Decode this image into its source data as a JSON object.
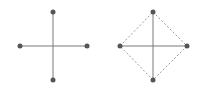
{
  "colors": {
    "background": "#ffffff",
    "solid_line": "#7a7a7a",
    "dashed_line": "#9a9a9a",
    "node": "#555555"
  },
  "figures": [
    {
      "name": "cross",
      "center": [
        53,
        46
      ],
      "nodes": [
        [
          53,
          12
        ],
        [
          20,
          46
        ],
        [
          87,
          46
        ],
        [
          53,
          80
        ]
      ],
      "solid_edges": [
        [
          [
            53,
            12
          ],
          [
            53,
            80
          ]
        ],
        [
          [
            20,
            46
          ],
          [
            87,
            46
          ]
        ]
      ],
      "dashed_edges": []
    },
    {
      "name": "diamond-cross",
      "center": [
        153,
        46
      ],
      "nodes": [
        [
          153,
          12
        ],
        [
          120,
          46
        ],
        [
          187,
          46
        ],
        [
          153,
          80
        ]
      ],
      "solid_edges": [
        [
          [
            153,
            12
          ],
          [
            153,
            80
          ]
        ],
        [
          [
            120,
            46
          ],
          [
            187,
            46
          ]
        ]
      ],
      "dashed_edges": [
        [
          [
            153,
            12
          ],
          [
            187,
            46
          ]
        ],
        [
          [
            187,
            46
          ],
          [
            153,
            80
          ]
        ],
        [
          [
            153,
            80
          ],
          [
            120,
            46
          ]
        ],
        [
          [
            120,
            46
          ],
          [
            153,
            12
          ]
        ]
      ]
    }
  ]
}
